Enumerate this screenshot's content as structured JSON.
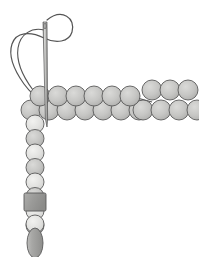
{
  "illustration": {
    "title": "Beading stitch diagram",
    "description": "Needle and thread with rows of beads forming an L-shaped arrangement",
    "canvas": {
      "width": 199,
      "height": 257,
      "background": "#ffffff"
    }
  },
  "palette": {
    "bead_light": "#e8e8e6",
    "bead_medium": "#c9c9c7",
    "bead_dark": "#a8a8a6",
    "bead_outline": "#5a5a5a",
    "square_bead_fill": "#9a9a98",
    "oval_bead_fill": "#a5a5a3",
    "needle_fill": "#b8b8b6",
    "needle_outline": "#555555",
    "thread": "#555555"
  },
  "needle": {
    "name": "sewing-needle",
    "eye_x": 45,
    "eye_y": 22,
    "tip_x": 47,
    "tip_y": 127,
    "width": 4
  },
  "thread": {
    "name": "thread-line",
    "loop_label": "thread loop at needle eye",
    "stroke_width": 1.1
  },
  "beads": {
    "row_top": {
      "label": "upper horizontal bead row",
      "left_group_count": 6,
      "right_group_count": 3,
      "y": 96,
      "radius": 10,
      "left_start_x": 40,
      "right_start_x": 152,
      "spacing": 18
    },
    "row_bottom": {
      "label": "lower horizontal bead row",
      "left_group_count": 7,
      "right_group_count": 4,
      "y": 110,
      "radius": 10,
      "left_start_x": 31,
      "right_start_x": 143,
      "spacing": 18
    },
    "column": {
      "label": "vertical bead column",
      "x": 35,
      "round_count": 8,
      "round_start_y": 124,
      "round_spacing": 14.5,
      "radius": 9,
      "square": {
        "label": "square bead",
        "y": 204,
        "size": 22
      },
      "round_after_square": {
        "label": "round bead below square",
        "y": 224,
        "radius": 9
      },
      "oval": {
        "label": "oval drop bead",
        "y": 243,
        "rx": 8,
        "ry": 15
      }
    }
  }
}
